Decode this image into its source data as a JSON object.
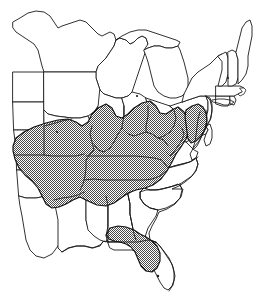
{
  "figure": {
    "kind": "distribution-range-map",
    "region": "Eastern United States",
    "title": "",
    "caption": "",
    "width_px": 253,
    "height_px": 295,
    "background_color": "#ffffff",
    "outline_color": "#1a1a1a",
    "range_fill_description": "50% checkerboard dither (stipple) pattern",
    "range_fill_color": "#8c8c8c",
    "range_outline_color": "#111111"
  },
  "legend": {
    "present": false,
    "entries": []
  },
  "labels": {
    "present": false,
    "items": []
  },
  "states_outlined": [
    "Minnesota",
    "Wisconsin",
    "Michigan",
    "Iowa",
    "Illinois",
    "Indiana",
    "Ohio",
    "Missouri",
    "Arkansas",
    "Louisiana",
    "Mississippi",
    "Alabama",
    "Tennessee",
    "Kentucky",
    "West Virginia",
    "Virginia",
    "North Carolina",
    "South Carolina",
    "Georgia",
    "Florida",
    "Maryland",
    "Delaware",
    "New Jersey",
    "Pennsylvania",
    "New York",
    "Connecticut",
    "Rhode Island",
    "Massachusetts",
    "Vermont",
    "New Hampshire",
    "Maine",
    "North Dakota",
    "South Dakota",
    "Nebraska",
    "Kansas",
    "Oklahoma",
    "Texas"
  ],
  "range_areas": [
    {
      "name": "main-range",
      "description": "Continuous shaded band across the mid-South and lower Ohio Valley",
      "states_covered": [
        "Missouri",
        "Arkansas",
        "Tennessee",
        "Kentucky",
        "West Virginia",
        "Virginia",
        "North Carolina",
        "South Carolina",
        "northern Georgia",
        "northern Alabama",
        "northern Mississippi",
        "southern Illinois",
        "southern Indiana",
        "southern Ohio"
      ]
    },
    {
      "name": "chesapeake-range",
      "description": "Disjunct shaded area on the Delmarva Peninsula and eastern Maryland",
      "states_covered": [
        "Maryland",
        "Delaware"
      ]
    },
    {
      "name": "florida-range",
      "description": "Disjunct shaded area across the Florida panhandle and north-central peninsula",
      "states_covered": [
        "Florida"
      ]
    }
  ]
}
